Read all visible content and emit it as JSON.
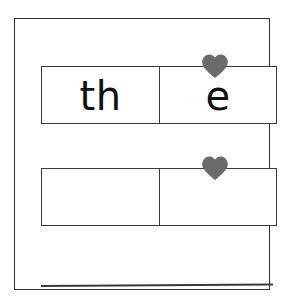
{
  "worksheet": {
    "title": "word-building-worksheet",
    "background_color": "#ffffff",
    "frame": {
      "name": "outer-frame",
      "border_color": "#2f2f2f"
    },
    "rows": [
      {
        "name": "word-row-1",
        "cells": [
          {
            "name": "word-cell-left",
            "text": "th",
            "has_heart": false
          },
          {
            "name": "word-cell-right",
            "text": "e",
            "has_heart": true
          }
        ]
      },
      {
        "name": "word-row-2",
        "cells": [
          {
            "name": "word-cell-left",
            "text": "",
            "has_heart": false
          },
          {
            "name": "word-cell-right",
            "text": "",
            "has_heart": true
          }
        ]
      }
    ],
    "heart": {
      "name": "heart-icon",
      "color": "#6b6b6b"
    },
    "writing_line": {
      "name": "writing-line",
      "color": "#3a3a3a"
    }
  }
}
